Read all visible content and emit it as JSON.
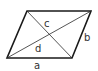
{
  "diagram": {
    "shape": "parallelogram",
    "vertices": {
      "top_left": [
        27,
        11
      ],
      "top_right": [
        91,
        11
      ],
      "bottom_right": [
        72,
        58
      ],
      "bottom_left": [
        7,
        58
      ]
    },
    "labels": {
      "a": "a",
      "b": "b",
      "c": "c",
      "d": "d"
    },
    "colors": {
      "stroke": "#1a1a1a",
      "label": "#333333",
      "background": "#ffffff"
    }
  }
}
